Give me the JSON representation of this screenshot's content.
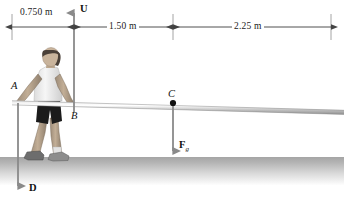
{
  "figure": {
    "kind": "free-body-diagram"
  },
  "dimensions": {
    "left_segment": "0.750 m",
    "middle_segment": "1.50 m",
    "right_segment": "2.25 m"
  },
  "points": {
    "a": "A",
    "b": "B",
    "c": "C"
  },
  "vectors": {
    "up_force": "U",
    "down_force": "D",
    "weight_symbol": "F",
    "weight_subscript": "g"
  },
  "colors": {
    "line": "#8a8a8a",
    "dim_line": "#6e6e6e",
    "text": "#111111",
    "ground_top": "#a6a6a6",
    "pole": "#c9c9c9",
    "skin": "#c9b49c",
    "shirt": "#f2f2f2",
    "shorts": "#1b1b1b",
    "hair": "#4a4038"
  }
}
